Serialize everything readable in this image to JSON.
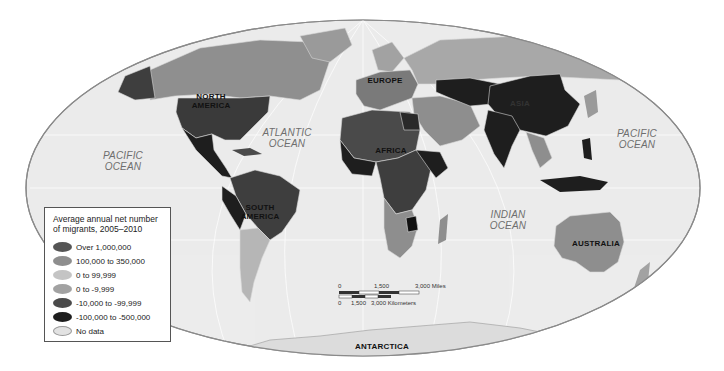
{
  "map": {
    "title": "Average annual net number of migrants, 2005–2010",
    "projection_shape": "ellipse",
    "colors": {
      "ocean": "#ececec",
      "outline": "#8a8a8a",
      "no_data": "#dedede"
    }
  },
  "legend": {
    "title_line1": "Average annual net number",
    "title_line2": "of migrants, 2005–2010",
    "items": [
      {
        "label": "Over 1,000,000",
        "color": "#555555"
      },
      {
        "label": "100,000 to 350,000",
        "color": "#8e8e8e"
      },
      {
        "label": "0 to 99,999",
        "color": "#c4c4c4"
      },
      {
        "label": "0 to -9,999",
        "color": "#a2a2a2"
      },
      {
        "label": "-10,000 to -99,999",
        "color": "#4a4a4a"
      },
      {
        "label": "-100,000 to -500,000",
        "color": "#1e1e1e"
      },
      {
        "label": "No data",
        "color": "#e2e2e2"
      }
    ]
  },
  "oceans": {
    "pacific_west": {
      "line1": "PACIFIC",
      "line2": "OCEAN"
    },
    "atlantic": {
      "line1": "ATLANTIC",
      "line2": "OCEAN"
    },
    "indian": {
      "line1": "INDIAN",
      "line2": "OCEAN"
    },
    "pacific_east": {
      "line1": "PACIFIC",
      "line2": "OCEAN"
    }
  },
  "continents": {
    "north_america": {
      "line1": "NORTH",
      "line2": "AMERICA"
    },
    "south_america": {
      "line1": "SOUTH",
      "line2": "AMERICA"
    },
    "europe": "EUROPE",
    "africa": "AFRICA",
    "asia": "ASIA",
    "australia": "AUSTRALIA",
    "antarctica": "ANTARCTICA"
  },
  "scale_bar": {
    "miles": {
      "start": "0",
      "mid": "1,500",
      "end": "3,000 Miles"
    },
    "kilometers": {
      "start": "0",
      "mid": "1,500",
      "end": "3,000 Kilometers"
    }
  }
}
